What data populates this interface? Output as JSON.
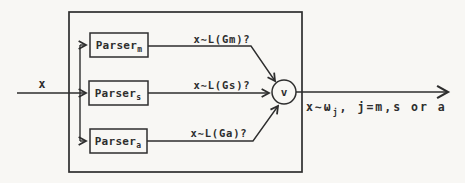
{
  "figure": {
    "background": "#f8f7f4",
    "ink": "#2e2e2e",
    "input": {
      "label": "x"
    },
    "parsers": [
      {
        "label": "Parser",
        "subscript": "m",
        "question": "x∼L(Gm)?"
      },
      {
        "label": "Parser",
        "subscript": "s",
        "question": "x∼L(Gs)?"
      },
      {
        "label": "Parser",
        "subscript": "a",
        "question": "x∼L(Ga)?"
      }
    ],
    "or_node": {
      "label": "v"
    },
    "output": {
      "prefix": "x∼ω",
      "subscript": "j",
      "suffix": ", j=m,s or a"
    }
  }
}
